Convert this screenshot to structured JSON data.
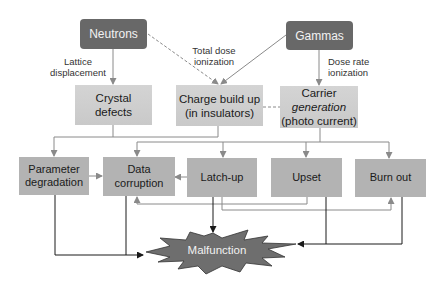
{
  "sources": {
    "neutrons": "Neutrons",
    "gammas": "Gammas"
  },
  "edge_labels": {
    "lattice_1": "Lattice",
    "lattice_2": "displacement",
    "total_dose_1": "Total dose",
    "total_dose_2": "ionization",
    "dose_rate_1": "Dose rate",
    "dose_rate_2": "ionization"
  },
  "mechanisms": {
    "crystal_1": "Crystal",
    "crystal_2": "defects",
    "charge_1": "Charge build up",
    "charge_2": "(in insulators)",
    "carrier_1": "Carrier",
    "carrier_2": "generation",
    "carrier_3": "(photo current)"
  },
  "effects": {
    "param_1": "Parameter",
    "param_2": "degradation",
    "data_1": "Data",
    "data_2": "corruption",
    "latchup": "Latch-up",
    "upset": "Upset",
    "burnout": "Burn out"
  },
  "outcome": {
    "malfunction": "Malfunction"
  },
  "colors": {
    "source_fill": "#686868",
    "mechanism_fill": "#cfcfcf",
    "effect_fill": "#b3b3b3",
    "malfunction_fill": "#6e6e6e",
    "gray_line": "#8a8a8a",
    "dark_line": "#1a1a1a"
  }
}
